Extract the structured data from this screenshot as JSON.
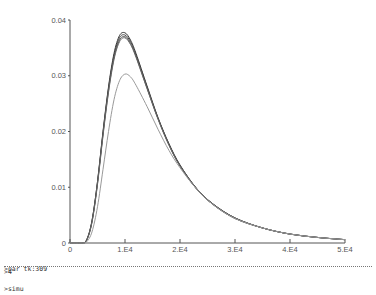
{
  "chart_data": {
    "type": "line",
    "title": "",
    "xlabel": "",
    "ylabel": "",
    "xlim": [
      0,
      50000
    ],
    "ylim": [
      0,
      0.04
    ],
    "grid": false,
    "legend": null,
    "x_ticks": [
      {
        "value": 0,
        "label": "0"
      },
      {
        "value": 10000,
        "label": "1.E4"
      },
      {
        "value": 20000,
        "label": "2.E4"
      },
      {
        "value": 30000,
        "label": "3.E4"
      },
      {
        "value": 40000,
        "label": "4.E4"
      },
      {
        "value": 50000,
        "label": "5.E4"
      }
    ],
    "y_ticks": [
      {
        "value": 0,
        "label": "0"
      },
      {
        "value": 0.01,
        "label": "0.01"
      },
      {
        "value": 0.02,
        "label": "0.02"
      },
      {
        "value": 0.03,
        "label": "0.03"
      },
      {
        "value": 0.04,
        "label": "0.04"
      }
    ],
    "x": [
      0,
      2000,
      3000,
      4000,
      5000,
      6000,
      7000,
      8000,
      9000,
      10000,
      11000,
      12000,
      14000,
      16000,
      18000,
      20000,
      23000,
      26000,
      30000,
      35000,
      40000,
      45000,
      50000
    ],
    "series": [
      {
        "name": "curve-1",
        "color": "#333333",
        "values": [
          0,
          0,
          0.0005,
          0.004,
          0.011,
          0.02,
          0.028,
          0.034,
          0.0372,
          0.0377,
          0.0364,
          0.034,
          0.0282,
          0.0225,
          0.0178,
          0.014,
          0.0098,
          0.007,
          0.0045,
          0.0027,
          0.0016,
          0.001,
          0.0006
        ]
      },
      {
        "name": "curve-2",
        "color": "#444444",
        "values": [
          0,
          0,
          0.0005,
          0.004,
          0.011,
          0.0198,
          0.0277,
          0.0336,
          0.0368,
          0.0373,
          0.0361,
          0.0337,
          0.028,
          0.0224,
          0.0177,
          0.0139,
          0.0098,
          0.007,
          0.0045,
          0.0027,
          0.0016,
          0.001,
          0.0006
        ]
      },
      {
        "name": "curve-3",
        "color": "#555555",
        "values": [
          0,
          0,
          0.0005,
          0.0038,
          0.0107,
          0.0195,
          0.0273,
          0.0332,
          0.0364,
          0.037,
          0.0358,
          0.0335,
          0.0278,
          0.0223,
          0.0176,
          0.0138,
          0.0097,
          0.0069,
          0.0044,
          0.0027,
          0.0016,
          0.001,
          0.0006
        ]
      },
      {
        "name": "curve-4",
        "color": "#666666",
        "values": [
          0,
          0,
          0.0004,
          0.0037,
          0.0105,
          0.0192,
          0.027,
          0.0329,
          0.0361,
          0.0368,
          0.0356,
          0.0333,
          0.0277,
          0.0222,
          0.0175,
          0.0138,
          0.0097,
          0.0069,
          0.0044,
          0.0027,
          0.0016,
          0.001,
          0.0006
        ]
      },
      {
        "name": "curve-5",
        "color": "#999999",
        "values": [
          0,
          0,
          0.0002,
          0.002,
          0.0065,
          0.0132,
          0.02,
          0.0257,
          0.0291,
          0.0303,
          0.0298,
          0.0283,
          0.0245,
          0.0204,
          0.0166,
          0.0135,
          0.0097,
          0.0069,
          0.0044,
          0.0027,
          0.0016,
          0.001,
          0.0006
        ]
      }
    ]
  },
  "console": {
    "lines": [
      ">par tk:309",
      ">simu"
    ],
    "prompt": ">4"
  }
}
